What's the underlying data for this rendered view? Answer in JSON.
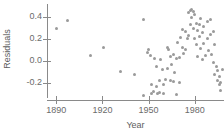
{
  "chart_data": {
    "type": "scatter",
    "title": "",
    "xlabel": "Year",
    "ylabel": "Residuals",
    "xlim": [
      1884,
      1999
    ],
    "ylim": [
      -0.36,
      0.52
    ],
    "xticks": [
      1890,
      1920,
      1950,
      1980
    ],
    "xtick_labels": [
      "1890",
      "1920",
      "1950",
      "1980"
    ],
    "yticks": [
      0.4,
      0.2,
      0.0,
      -0.2
    ],
    "ytick_labels": [
      "0.4",
      "0.2",
      "0.0",
      "-0.2"
    ],
    "grid": false,
    "legend": false,
    "marker_color": "#9a9a9a",
    "axis_color": "#8a8a8a",
    "series": [
      {
        "name": "residuals",
        "x": [
          1890,
          1897,
          1912,
          1921,
          1932,
          1941,
          1947,
          1947,
          1949,
          1950,
          1951,
          1952,
          1952,
          1953,
          1954,
          1955,
          1955,
          1956,
          1957,
          1957,
          1958,
          1959,
          1960,
          1960,
          1961,
          1962,
          1962,
          1963,
          1964,
          1964,
          1965,
          1966,
          1966,
          1967,
          1968,
          1968,
          1969,
          1970,
          1970,
          1971,
          1972,
          1972,
          1973,
          1974,
          1974,
          1975,
          1976,
          1976,
          1977,
          1977,
          1978,
          1978,
          1979,
          1979,
          1980,
          1980,
          1981,
          1981,
          1982,
          1982,
          1983,
          1983,
          1984,
          1984,
          1985,
          1985,
          1986,
          1986,
          1987,
          1988,
          1988,
          1989,
          1990,
          1990,
          1991,
          1992,
          1992,
          1993,
          1993,
          1994,
          1995,
          1995,
          1996,
          1996,
          1997,
          1997,
          1998
        ],
        "y": [
          0.3,
          0.37,
          0.05,
          0.12,
          -0.1,
          -0.13,
          0.38,
          -0.32,
          0.08,
          0.1,
          0.05,
          -0.22,
          -0.3,
          -0.28,
          0.02,
          -0.05,
          -0.24,
          -0.3,
          -0.18,
          -0.29,
          0.01,
          -0.08,
          -0.22,
          -0.3,
          -0.17,
          0.12,
          -0.07,
          0.1,
          0.04,
          -0.18,
          -0.03,
          0.06,
          -0.19,
          -0.11,
          0.02,
          -0.31,
          0.17,
          0.03,
          -0.2,
          0.21,
          0.12,
          0.29,
          0.07,
          0.27,
          0.1,
          0.2,
          0.44,
          0.23,
          0.46,
          0.33,
          0.47,
          0.4,
          0.45,
          0.3,
          0.42,
          0.2,
          0.34,
          0.15,
          0.28,
          0.04,
          0.33,
          0.22,
          0.39,
          0.11,
          0.26,
          0.01,
          0.31,
          0.16,
          0.05,
          0.36,
          0.2,
          0.09,
          0.38,
          0.24,
          0.06,
          0.27,
          -0.02,
          0.15,
          -0.13,
          -0.05,
          -0.18,
          -0.09,
          -0.22,
          -0.14,
          -0.27,
          -0.2,
          -0.08
        ]
      }
    ]
  }
}
